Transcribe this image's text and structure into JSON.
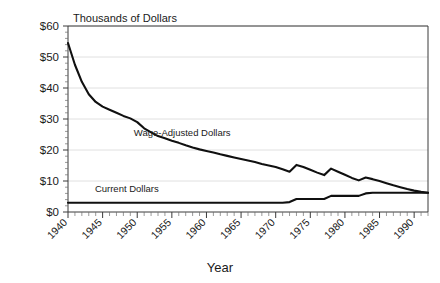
{
  "chart_data": {
    "type": "line",
    "title": "",
    "xlabel": "Year",
    "ylabel": "Thousands of Dollars",
    "xlim": [
      1940,
      1992
    ],
    "ylim": [
      0,
      60
    ],
    "grid": true,
    "legend_position": "inline-annotations",
    "y_ticks": [
      0,
      10,
      20,
      30,
      40,
      50,
      60
    ],
    "y_tick_labels": [
      "$0",
      "$10",
      "$20",
      "$30",
      "$40",
      "$50",
      "$60"
    ],
    "x_ticks": [
      1940,
      1945,
      1950,
      1955,
      1960,
      1965,
      1970,
      1975,
      1980,
      1985,
      1990
    ],
    "x_tick_labels": [
      "1940",
      "1945",
      "1950",
      "1955",
      "1960",
      "1965",
      "1970",
      "1975",
      "1980",
      "1985",
      "1990"
    ],
    "x_minor_tick_step": 1,
    "series": [
      {
        "name": "Wage-Adjusted Dollars",
        "color": "#101010",
        "x": [
          1940,
          1941,
          1942,
          1943,
          1944,
          1945,
          1946,
          1947,
          1948,
          1949,
          1950,
          1951,
          1952,
          1953,
          1954,
          1955,
          1956,
          1957,
          1958,
          1959,
          1960,
          1961,
          1962,
          1963,
          1964,
          1965,
          1966,
          1967,
          1968,
          1969,
          1970,
          1971,
          1972,
          1973,
          1974,
          1975,
          1976,
          1977,
          1978,
          1979,
          1980,
          1981,
          1982,
          1983,
          1984,
          1985,
          1986,
          1987,
          1988,
          1989,
          1990,
          1991,
          1992
        ],
        "values": [
          54.5,
          47.5,
          42.0,
          38.0,
          35.5,
          34.0,
          33.0,
          32.0,
          31.0,
          30.2,
          29.0,
          27.0,
          25.7,
          24.5,
          23.8,
          23.0,
          22.3,
          21.5,
          20.8,
          20.2,
          19.7,
          19.2,
          18.6,
          18.1,
          17.6,
          17.1,
          16.6,
          16.1,
          15.5,
          15.0,
          14.5,
          13.8,
          13.0,
          15.2,
          14.5,
          13.6,
          12.7,
          11.9,
          14.0,
          13.0,
          12.0,
          11.0,
          10.2,
          11.1,
          10.6,
          10.0,
          9.3,
          8.6,
          8.0,
          7.4,
          6.9,
          6.5,
          6.2
        ]
      },
      {
        "name": "Current Dollars",
        "color": "#101010",
        "x": [
          1940,
          1945,
          1950,
          1955,
          1960,
          1965,
          1970,
          1971,
          1972,
          1973,
          1974,
          1975,
          1976,
          1977,
          1978,
          1979,
          1980,
          1981,
          1982,
          1983,
          1984,
          1985,
          1986,
          1987,
          1988,
          1989,
          1990,
          1991,
          1992
        ],
        "values": [
          3.0,
          3.0,
          3.0,
          3.0,
          3.0,
          3.0,
          3.0,
          3.0,
          3.2,
          4.2,
          4.2,
          4.2,
          4.2,
          4.2,
          5.2,
          5.2,
          5.2,
          5.2,
          5.2,
          6.0,
          6.2,
          6.2,
          6.2,
          6.2,
          6.2,
          6.2,
          6.2,
          6.2,
          6.2
        ]
      }
    ],
    "annotations": [
      {
        "name": "wage-adjusted-dollars-label",
        "text": "Wage-Adjusted Dollars",
        "x": 1956.5,
        "y": 24.5
      },
      {
        "name": "current-dollars-label",
        "text": "Current Dollars",
        "x": 1948.5,
        "y": 6.4
      }
    ]
  }
}
